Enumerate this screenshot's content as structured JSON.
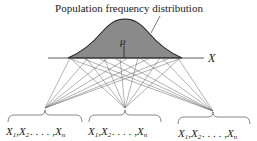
{
  "diagram": {
    "title": "Population frequency distribution",
    "axis_label": "X",
    "mean_label": "μ",
    "curve_fill": "#8a8a8a",
    "line_color": "#555555",
    "samples": [
      {
        "x1": "X",
        "s1": "1",
        "x2": "X",
        "s2": "2",
        "dots": ". . . . ,",
        "xn": "X",
        "sn": "n"
      },
      {
        "x1": "X",
        "s1": "1",
        "x2": "X",
        "s2": "2",
        "dots": ". . . . ,",
        "xn": "X",
        "sn": "n"
      },
      {
        "x1": "X",
        "s1": "1",
        "x2": "X",
        "s2": "2",
        "dots": ". . . . ,",
        "xn": "X",
        "sn": "n"
      }
    ],
    "sample_separator": ","
  }
}
